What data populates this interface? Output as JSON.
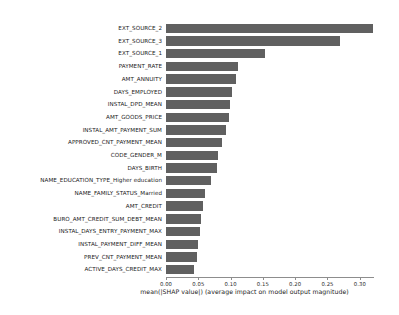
{
  "chart_data": {
    "type": "bar",
    "orientation": "horizontal",
    "title": "",
    "subtitle": "",
    "xlabel": "mean(|SHAP value|) (average impact on model output magnitude)",
    "ylabel": "",
    "xlim": [
      0.0,
      0.322
    ],
    "ylim": null,
    "grid": false,
    "legend": null,
    "bar_color": "#606060",
    "background_color": "#ffffff",
    "axis_color": "#8d8d8d",
    "label_color": "#1a1a1a",
    "xticks": [
      0.0,
      0.05,
      0.1,
      0.15,
      0.2,
      0.25,
      0.3
    ],
    "xtick_labels": [
      "0.00",
      "0.05",
      "0.10",
      "0.15",
      "0.20",
      "0.25",
      "0.30"
    ],
    "categories": [
      "EXT_SOURCE_2",
      "EXT_SOURCE_3",
      "EXT_SOURCE_1",
      "PAYMENT_RATE",
      "AMT_ANNUITY",
      "DAYS_EMPLOYED",
      "INSTAL_DPD_MEAN",
      "AMT_GOODS_PRICE",
      "INSTAL_AMT_PAYMENT_SUM",
      "APPROVED_CNT_PAYMENT_MEAN",
      "CODE_GENDER_M",
      "DAYS_BIRTH",
      "NAME_EDUCATION_TYPE_Higher education",
      "NAME_FAMILY_STATUS_Married",
      "AMT_CREDIT",
      "BURO_AMT_CREDIT_SUM_DEBT_MEAN",
      "INSTAL_DAYS_ENTRY_PAYMENT_MAX",
      "INSTAL_PAYMENT_DIFF_MEAN",
      "PREV_CNT_PAYMENT_MEAN",
      "ACTIVE_DAYS_CREDIT_MAX"
    ],
    "values": [
      0.32,
      0.269,
      0.153,
      0.111,
      0.108,
      0.102,
      0.099,
      0.098,
      0.093,
      0.087,
      0.08,
      0.079,
      0.07,
      0.06,
      0.057,
      0.054,
      0.053,
      0.05,
      0.048,
      0.043
    ]
  },
  "footer": {
    "text": ""
  }
}
